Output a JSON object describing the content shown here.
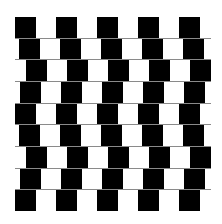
{
  "figure": {
    "name": "Cafe wall illusion",
    "rows": 9,
    "tile_width": 20.5,
    "row_height": 21,
    "row_offsets": [
      0,
      4,
      11,
      5,
      0,
      4,
      11,
      5,
      0
    ],
    "colors": {
      "dark": "#000000",
      "light": "#ffffff",
      "mortar": "#8a8a8a",
      "background": "#ffffff"
    }
  }
}
